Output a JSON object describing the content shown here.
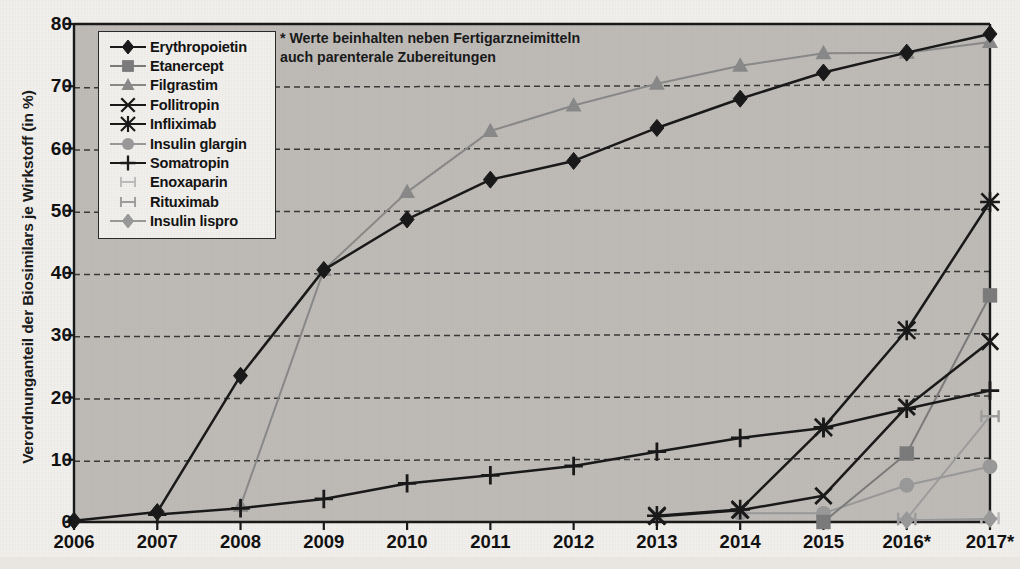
{
  "chart_data": {
    "type": "line",
    "title": "",
    "xlabel": "",
    "ylabel": "Verordnunganteil der Biosimilars je Wirkstoff (in %)",
    "categories": [
      "2006",
      "2007",
      "2008",
      "2009",
      "2010",
      "2011",
      "2012",
      "2013",
      "2014",
      "2015",
      "2016*",
      "2017*"
    ],
    "ylim": [
      0,
      80
    ],
    "yticks": [
      0,
      10,
      20,
      30,
      40,
      50,
      60,
      70,
      80
    ],
    "grid": "horizontal-dashed",
    "legend_position": "upper-left-inside",
    "annotation": "* Werte beinhalten neben Fertigarzneimitteln\nauch parenterale Zubereitungen",
    "series": [
      {
        "name": "Erythropoietin",
        "marker": "diamond",
        "color": "#1a1a1a",
        "values": [
          0.2,
          1.6,
          23.5,
          40.5,
          48.6,
          55.0,
          58.0,
          63.3,
          68.0,
          72.2,
          75.4,
          78.4
        ]
      },
      {
        "name": "Etanercept",
        "marker": "square",
        "color": "#7c7c7c",
        "values": [
          null,
          null,
          null,
          null,
          null,
          null,
          null,
          null,
          null,
          0.0,
          11.0,
          36.4
        ]
      },
      {
        "name": "Filgrastim",
        "marker": "triangle",
        "color": "#8a8a8a",
        "values": [
          null,
          null,
          2.6,
          40.5,
          53.0,
          62.8,
          66.9,
          70.4,
          73.3,
          75.3,
          75.4,
          77.1
        ]
      },
      {
        "name": "Follitropin",
        "marker": "x",
        "color": "#1a1a1a",
        "values": [
          null,
          null,
          null,
          null,
          null,
          null,
          null,
          0.9,
          1.9,
          4.2,
          18.5,
          29.0
        ]
      },
      {
        "name": "Infliximab",
        "marker": "asterisk",
        "color": "#1a1a1a",
        "values": [
          null,
          null,
          null,
          null,
          null,
          null,
          null,
          1.0,
          2.0,
          15.2,
          30.8,
          51.4
        ]
      },
      {
        "name": "Insulin glargin",
        "marker": "circle",
        "color": "#9a9a9a",
        "values": [
          null,
          null,
          null,
          null,
          null,
          null,
          null,
          null,
          1.4,
          1.4,
          5.9,
          8.9
        ]
      },
      {
        "name": "Somatropin",
        "marker": "plus",
        "color": "#1a1a1a",
        "values": [
          null,
          1.2,
          2.2,
          3.7,
          6.2,
          7.5,
          9.0,
          11.3,
          13.5,
          15.1,
          18.2,
          21.1
        ]
      },
      {
        "name": "Enoxaparin",
        "marker": "ibar",
        "color": "#bdbdbd",
        "values": [
          null,
          null,
          null,
          null,
          null,
          null,
          null,
          null,
          null,
          null,
          0.4,
          0.6
        ]
      },
      {
        "name": "Rituximab",
        "marker": "ibar",
        "color": "#9e9e9e",
        "values": [
          null,
          null,
          null,
          null,
          null,
          null,
          null,
          null,
          null,
          null,
          0.5,
          17.0
        ]
      },
      {
        "name": "Insulin lispro",
        "marker": "diamond",
        "color": "#9a9a9a",
        "values": [
          null,
          null,
          null,
          null,
          null,
          null,
          null,
          null,
          null,
          null,
          0.3,
          0.5
        ]
      }
    ]
  },
  "axis": {
    "ytick_labels": [
      "0",
      "10",
      "20",
      "30",
      "40",
      "50",
      "60",
      "70",
      "80"
    ],
    "xtick_labels": [
      "2006",
      "2007",
      "2008",
      "2009",
      "2010",
      "2011",
      "2012",
      "2013",
      "2014",
      "2015",
      "2016*",
      "2017*"
    ]
  },
  "legend": {
    "items": [
      {
        "label": "Erythropoietin"
      },
      {
        "label": "Etanercept"
      },
      {
        "label": "Filgrastim"
      },
      {
        "label": "Follitropin"
      },
      {
        "label": "Infliximab"
      },
      {
        "label": "Insulin glargin"
      },
      {
        "label": "Somatropin"
      },
      {
        "label": "Enoxaparin"
      },
      {
        "label": "Rituximab"
      },
      {
        "label": "Insulin lispro"
      }
    ]
  },
  "colors": {
    "plot_background": "#bfbcb8",
    "page_background": "#f2f0ec",
    "axis": "#1a1a1a",
    "gridline": "#3a3a3a"
  }
}
